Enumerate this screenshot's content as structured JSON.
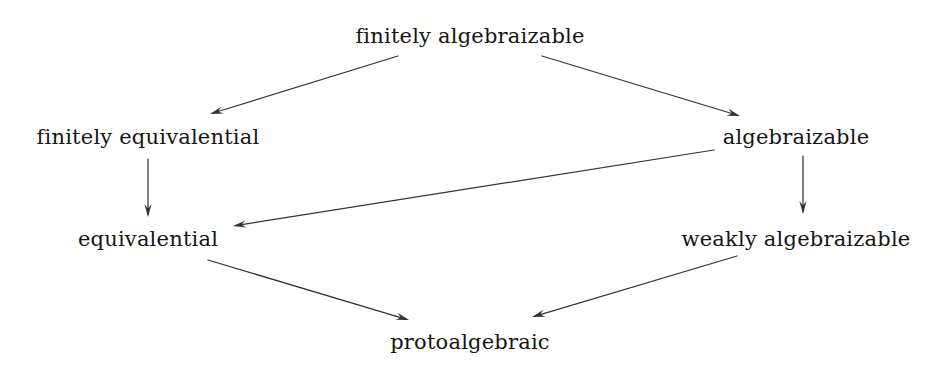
{
  "figure": {
    "kind": "implication-hierarchy-diagram",
    "background_color": "#ffffff",
    "ink_color": "#333333",
    "text_color": "#151515"
  },
  "nodes": [
    {
      "id": "finitely-algebraizable",
      "label": "finitely algebraizable",
      "x": 470,
      "y": 36
    },
    {
      "id": "finitely-equivalential",
      "label": "finitely equivalential",
      "x": 148,
      "y": 137
    },
    {
      "id": "algebraizable",
      "label": "algebraizable",
      "x": 796,
      "y": 137
    },
    {
      "id": "equivalential",
      "label": "equivalential",
      "x": 148,
      "y": 239
    },
    {
      "id": "weakly-algebraizable",
      "label": "weakly algebraizable",
      "x": 796,
      "y": 239
    },
    {
      "id": "protoalgebraic",
      "label": "protoalgebraic",
      "x": 470,
      "y": 342
    }
  ],
  "edges": [
    {
      "id": "fa-to-fe",
      "from": "finitely algebraizable",
      "to": "finitely equivalential",
      "x1": 398,
      "y1": 56,
      "x2": 210,
      "y2": 114
    },
    {
      "id": "fa-to-a",
      "from": "finitely algebraizable",
      "to": "algebraizable",
      "x1": 542,
      "y1": 56,
      "x2": 740,
      "y2": 116
    },
    {
      "id": "fe-to-e",
      "from": "finitely equivalential",
      "to": "equivalential",
      "x1": 148,
      "y1": 159,
      "x2": 148,
      "y2": 217
    },
    {
      "id": "a-to-wa",
      "from": "algebraizable",
      "to": "weakly algebraizable",
      "x1": 803,
      "y1": 156,
      "x2": 803,
      "y2": 214
    },
    {
      "id": "a-to-e",
      "from": "algebraizable",
      "to": "equivalential",
      "x1": 714,
      "y1": 150,
      "x2": 233,
      "y2": 226
    },
    {
      "id": "e-to-p",
      "from": "equivalential",
      "to": "protoalgebraic",
      "x1": 208,
      "y1": 260,
      "x2": 409,
      "y2": 320
    },
    {
      "id": "wa-to-p",
      "from": "weakly algebraizable",
      "to": "protoalgebraic",
      "x1": 737,
      "y1": 256,
      "x2": 532,
      "y2": 317
    }
  ]
}
